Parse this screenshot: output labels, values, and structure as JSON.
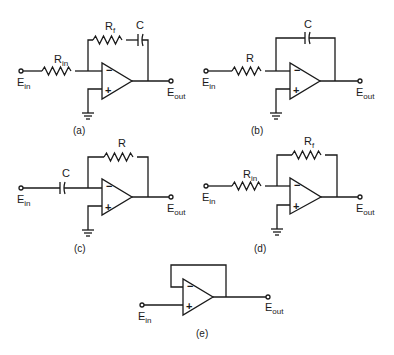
{
  "figure": {
    "circuits": [
      {
        "id": "a",
        "caption": "(a)",
        "input": {
          "main": "E",
          "sub": "in"
        },
        "output": {
          "main": "E",
          "sub": "out"
        },
        "input_component": {
          "type": "resistor",
          "main": "R",
          "sub": "in"
        },
        "feedback_components": [
          {
            "type": "resistor",
            "main": "R",
            "sub": "f"
          },
          {
            "type": "capacitor",
            "main": "C",
            "sub": ""
          }
        ],
        "inverting_sign": "−",
        "noninverting_sign": "+"
      },
      {
        "id": "b",
        "caption": "(b)",
        "input": {
          "main": "E",
          "sub": "in"
        },
        "output": {
          "main": "E",
          "sub": "out"
        },
        "input_component": {
          "type": "resistor",
          "main": "R",
          "sub": ""
        },
        "feedback_components": [
          {
            "type": "capacitor",
            "main": "C",
            "sub": ""
          }
        ],
        "inverting_sign": "−",
        "noninverting_sign": "+"
      },
      {
        "id": "c",
        "caption": "(c)",
        "input": {
          "main": "E",
          "sub": "in"
        },
        "output": {
          "main": "E",
          "sub": "out"
        },
        "input_component": {
          "type": "capacitor",
          "main": "C",
          "sub": ""
        },
        "feedback_components": [
          {
            "type": "resistor",
            "main": "R",
            "sub": ""
          }
        ],
        "inverting_sign": "−",
        "noninverting_sign": "+"
      },
      {
        "id": "d",
        "caption": "(d)",
        "input": {
          "main": "E",
          "sub": "in"
        },
        "output": {
          "main": "E",
          "sub": "out"
        },
        "input_component": {
          "type": "resistor",
          "main": "R",
          "sub": "in"
        },
        "feedback_components": [
          {
            "type": "resistor",
            "main": "R",
            "sub": "f"
          }
        ],
        "inverting_sign": "−",
        "noninverting_sign": "+"
      },
      {
        "id": "e",
        "caption": "(e)",
        "input": {
          "main": "E",
          "sub": "in"
        },
        "output": {
          "main": "E",
          "sub": "out"
        },
        "input_component": null,
        "feedback_components": [],
        "inverting_sign": "−",
        "noninverting_sign": "+"
      }
    ]
  }
}
